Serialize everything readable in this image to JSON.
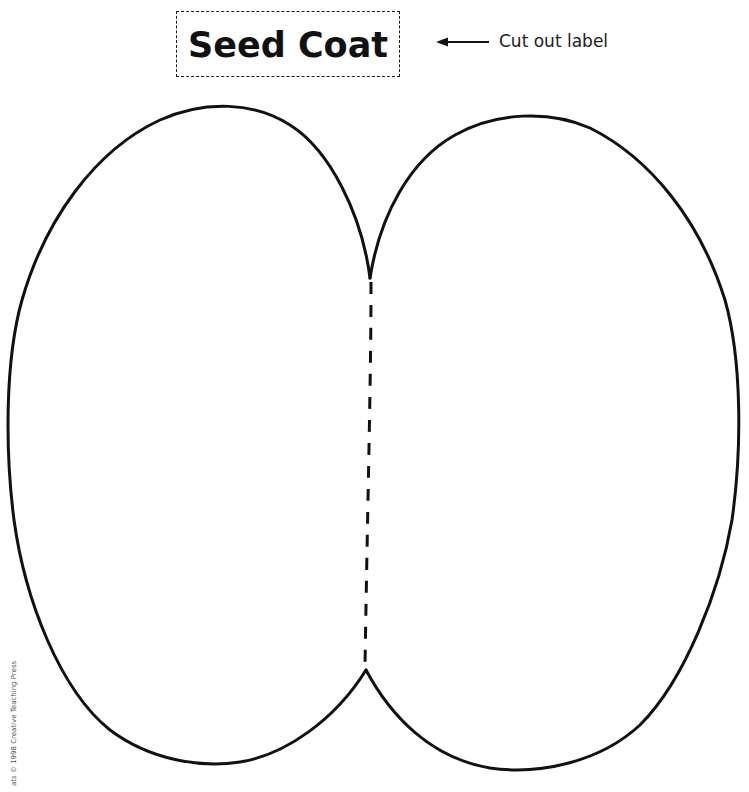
{
  "label": {
    "text": "Seed Coat"
  },
  "instruction": {
    "arrow_icon": "left-arrow-icon",
    "text": "Cut out label"
  },
  "figure": {
    "name": "seed-coat-outline",
    "lobes": [
      "left",
      "right"
    ],
    "fold_line": "dashed",
    "stroke_color": "#111111"
  },
  "footer": {
    "copyright": "ats © 1998 Creative Teaching Press"
  }
}
